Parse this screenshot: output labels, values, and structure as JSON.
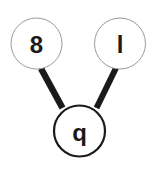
{
  "diagram": {
    "type": "graph",
    "background_color": "#ffffff",
    "edge_color": "#1a1a1a",
    "node_fill_color": "#ffffff",
    "parent_border_color": "#9a9a9a",
    "child_border_color": "#1a1a1a",
    "label_color": "#1a1a1a",
    "nodes": [
      {
        "id": "node-left",
        "label": "8",
        "role": "parent",
        "cx": 36.5,
        "cy": 43.5,
        "r": 25.5,
        "border_width": 1,
        "border_color": "#9a9a9a",
        "font_size": 24
      },
      {
        "id": "node-right",
        "label": "l",
        "role": "parent",
        "cx": 120,
        "cy": 43.5,
        "r": 25.5,
        "border_width": 1,
        "border_color": "#9a9a9a",
        "font_size": 24
      },
      {
        "id": "node-bottom",
        "label": "q",
        "role": "child",
        "cx": 79.5,
        "cy": 131,
        "r": 25.5,
        "border_width": 2.2,
        "border_color": "#1a1a1a",
        "font_size": 24
      }
    ],
    "edges": [
      {
        "id": "edge-left",
        "from": "node-left",
        "to": "node-bottom",
        "x1": 41,
        "y1": 68.5,
        "x2": 62.5,
        "y2": 108,
        "width": 6.5
      },
      {
        "id": "edge-right",
        "from": "node-right",
        "to": "node-bottom",
        "x1": 116,
        "y1": 68,
        "x2": 96.5,
        "y2": 108,
        "width": 6
      }
    ]
  }
}
